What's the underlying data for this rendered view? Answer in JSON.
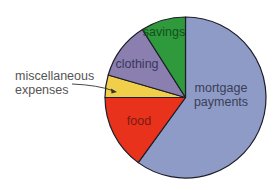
{
  "chart_data": {
    "type": "pie",
    "title": "",
    "start_angle": "top (12 o'clock), clockwise",
    "slices": [
      {
        "label": "mortgage payments",
        "label_lines": [
          "mortgage",
          "payments"
        ],
        "value": 60,
        "color": "#8e9bc6",
        "label_color": "#3a3e58"
      },
      {
        "label": "food",
        "label_lines": [
          "food"
        ],
        "value": 15,
        "color": "#e8321c",
        "label_color": "#7a1a10"
      },
      {
        "label": "miscellaneous expenses",
        "label_lines": [
          "miscellaneous",
          "expenses"
        ],
        "value": 4.5,
        "color": "#f2cf4a",
        "label_color": "#555555",
        "external_label": true
      },
      {
        "label": "clothing",
        "label_lines": [
          "clothing"
        ],
        "value": 11.5,
        "color": "#8a7fae",
        "label_color": "#3a3560"
      },
      {
        "label": "savings",
        "label_lines": [
          "savings"
        ],
        "value": 9,
        "color": "#2e9a3c",
        "label_color": "#14501c"
      }
    ],
    "legend": "none (labels on slices)",
    "units": "percent of budget"
  },
  "labels": {
    "mortgage_1": "mortgage",
    "mortgage_2": "payments",
    "food": "food",
    "misc_1": "miscellaneous",
    "misc_2": "expenses",
    "clothing": "clothing",
    "savings": "savings"
  }
}
